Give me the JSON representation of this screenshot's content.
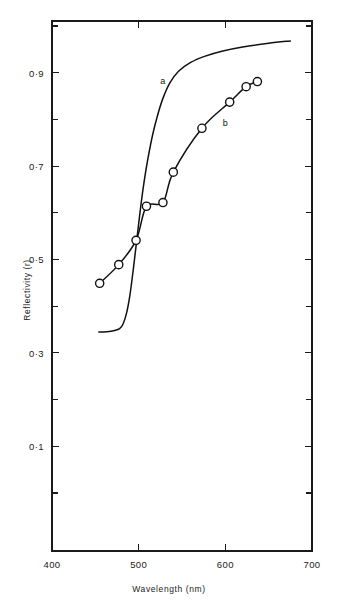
{
  "chart_data": {
    "type": "line",
    "title": "",
    "xlabel": "Wavelength (nm)",
    "ylabel": "Reflectivity (r)",
    "xlim": [
      400,
      700
    ],
    "ylim": [
      0.0,
      1.0
    ],
    "grid": false,
    "legend": "inline-curve-labels",
    "x_ticks_major": [
      400,
      500,
      600,
      700
    ],
    "x_tick_labels": [
      "400",
      "500",
      "600",
      "700"
    ],
    "y_ticks_major": [
      0.1,
      0.3,
      0.5,
      0.7,
      0.9
    ],
    "y_tick_labels": [
      "0·1",
      "0·3",
      "0·5",
      "0·7",
      "0·9"
    ],
    "y_ticks_minor": [
      0.2,
      0.4,
      0.6,
      0.8
    ],
    "series": [
      {
        "name": "a",
        "label": "a",
        "label_x": 525,
        "label_y": 0.875,
        "markers": false,
        "x": [
          454,
          460,
          466,
          472,
          478,
          482,
          486,
          490,
          494,
          498,
          502,
          506,
          510,
          516,
          522,
          528,
          536,
          546,
          560,
          576,
          596,
          620,
          650,
          675
        ],
        "y": [
          0.345,
          0.345,
          0.346,
          0.348,
          0.352,
          0.362,
          0.385,
          0.425,
          0.482,
          0.545,
          0.608,
          0.663,
          0.709,
          0.766,
          0.81,
          0.845,
          0.878,
          0.903,
          0.922,
          0.935,
          0.946,
          0.955,
          0.963,
          0.968
        ]
      },
      {
        "name": "b",
        "label": "b",
        "label_x": 597,
        "label_y": 0.785,
        "markers": true,
        "x": [
          455,
          477,
          497,
          509,
          528,
          540,
          573,
          605,
          624,
          637
        ],
        "y": [
          0.449,
          0.489,
          0.541,
          0.614,
          0.622,
          0.687,
          0.781,
          0.837,
          0.87,
          0.881
        ]
      }
    ]
  }
}
